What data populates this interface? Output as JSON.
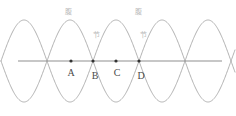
{
  "figure": {
    "width": 236,
    "height": 116,
    "background_color": "#ffffff",
    "axis": {
      "name": "horizontal-axis",
      "x_start": 18,
      "x_end": 222,
      "y": 61,
      "color": "#909090",
      "stroke_width": 1.1
    },
    "waves": {
      "color": "#a8a8a8",
      "stroke_width": 0.9,
      "amplitude": 41,
      "wavelength": 92,
      "x_start": 1,
      "x_end": 235,
      "center_y": 61,
      "phase_zero_x": 47
    }
  },
  "chart_data": {
    "type": "line",
    "title": "",
    "xlabel": "",
    "ylabel": "",
    "grid": false,
    "legend": false,
    "xlim": [
      0,
      236
    ],
    "ylim": [
      -41,
      41
    ],
    "series": [
      {
        "name": "wave-1",
        "form": "sine",
        "amplitude": 41,
        "wavelength": 92,
        "phase_zero_x": 47
      },
      {
        "name": "wave-2",
        "form": "inverted-sine",
        "amplitude": -41,
        "wavelength": 92,
        "phase_zero_x": 47
      }
    ],
    "nodes_x": [
      47,
      93,
      139,
      185
    ],
    "antinodes_x": [
      70,
      116,
      162,
      208
    ]
  },
  "annotations": {
    "antinode_labels": [
      {
        "name": "antinode-label-1",
        "text": "腹",
        "x": 68,
        "y": 9
      },
      {
        "name": "antinode-label-2",
        "text": "腹",
        "x": 138,
        "y": 9
      }
    ],
    "node_labels": [
      {
        "name": "node-label-1",
        "text": "节",
        "x": 96,
        "y": 32
      },
      {
        "name": "node-label-2",
        "text": "节",
        "x": 143,
        "y": 32
      }
    ],
    "points": [
      {
        "name": "point-a",
        "label": "A",
        "x": 71,
        "y": 61,
        "label_x": 71,
        "label_y": 68,
        "has_dot": true
      },
      {
        "name": "point-b",
        "label": "B",
        "x": 93,
        "y": 61,
        "label_x": 95,
        "label_y": 71,
        "has_dot": true
      },
      {
        "name": "point-c",
        "label": "C",
        "x": 116,
        "y": 61,
        "label_x": 117,
        "label_y": 68,
        "has_dot": true
      },
      {
        "name": "point-d",
        "label": "D",
        "x": 139,
        "y": 61,
        "label_x": 141,
        "label_y": 71,
        "has_dot": true
      }
    ],
    "dot": {
      "color": "#333333",
      "radius": 1.6
    }
  }
}
